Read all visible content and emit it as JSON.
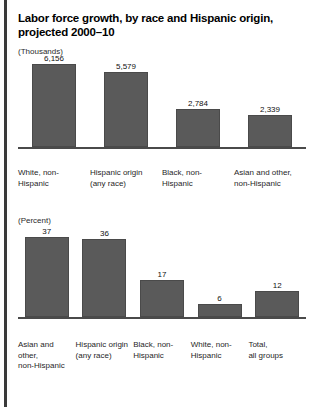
{
  "figure": {
    "title": "Labor force growth, by race and Hispanic origin, projected 2000–10"
  },
  "chart_data": [
    {
      "type": "bar",
      "title": "Labor force growth, by race and Hispanic origin, projected 2000–10",
      "unit_label": "(Thousands)",
      "ylabel": "Thousands",
      "xlabel": "",
      "grid": false,
      "legend": "none",
      "ylim": [
        0,
        6156
      ],
      "categories": [
        "White, non-\nHispanic",
        "Hispanic origin\n(any race)",
        "Black, non-\nHispanic",
        "Asian and other,\nnon-Hispanic"
      ],
      "values": [
        6156,
        5579,
        2784,
        2339
      ],
      "value_labels": [
        "6,156",
        "5,579",
        "2,784",
        "2,339"
      ]
    },
    {
      "type": "bar",
      "title": "",
      "unit_label": "(Percent)",
      "ylabel": "Percent",
      "xlabel": "",
      "grid": false,
      "legend": "none",
      "ylim": [
        0,
        37
      ],
      "categories": [
        "Asian and other,\nnon-Hispanic",
        "Hispanic origin\n(any race)",
        "Black, non-\nHispanic",
        "White, non-\nHispanic",
        "Total,\nall groups"
      ],
      "values": [
        37,
        36,
        17,
        6,
        12
      ],
      "value_labels": [
        "37",
        "36",
        "17",
        "6",
        "12"
      ]
    }
  ],
  "colors": {
    "bar_fill": "#5a5a5a",
    "bar_stroke": "#4a4a4a",
    "axis": "#4a4a4a",
    "text": "#1a1a1a",
    "left_rule": "#3a3a3a",
    "background": "#ffffff"
  }
}
